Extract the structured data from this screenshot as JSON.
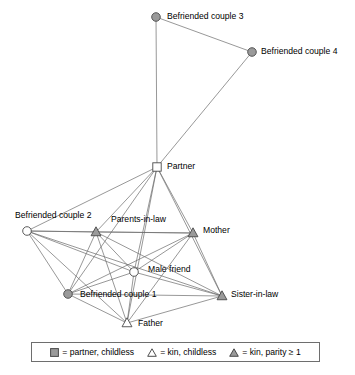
{
  "figure": {
    "type": "network-diagram"
  },
  "nodes": [
    {
      "id": "befriended_couple_3",
      "label": "Befriended couple 3",
      "shape": "circle",
      "fill": "#9a9a9a",
      "x": 156,
      "y": 17,
      "label_x": 167,
      "label_y": 17,
      "label_anchor": "start"
    },
    {
      "id": "befriended_couple_4",
      "label": "Befriended couple 4",
      "shape": "circle",
      "fill": "#9a9a9a",
      "x": 252,
      "y": 52,
      "label_x": 261,
      "label_y": 52,
      "label_anchor": "start"
    },
    {
      "id": "partner",
      "label": "Partner",
      "shape": "square",
      "fill": "#ffffff",
      "x": 157,
      "y": 167,
      "label_x": 167,
      "label_y": 167,
      "label_anchor": "start"
    },
    {
      "id": "befriended_couple_2",
      "label": "Befriended couple 2",
      "shape": "circle",
      "fill": "#ffffff",
      "x": 27,
      "y": 231,
      "label_x": 15,
      "label_y": 216,
      "label_anchor": "start"
    },
    {
      "id": "parents_in_law",
      "label": "Parents-in-law",
      "shape": "triangle",
      "fill": "#9a9a9a",
      "x": 96,
      "y": 232,
      "label_x": 111,
      "label_y": 220,
      "label_anchor": "start"
    },
    {
      "id": "mother",
      "label": "Mother",
      "shape": "triangle",
      "fill": "#9a9a9a",
      "x": 193,
      "y": 233,
      "label_x": 203,
      "label_y": 231,
      "label_anchor": "start"
    },
    {
      "id": "male_friend",
      "label": "Male friend",
      "shape": "circle",
      "fill": "#ffffff",
      "x": 134,
      "y": 272,
      "label_x": 148,
      "label_y": 270,
      "label_anchor": "start"
    },
    {
      "id": "befriended_couple_1",
      "label": "Befriended couple 1",
      "shape": "circle",
      "fill": "#9a9a9a",
      "x": 68,
      "y": 294,
      "label_x": 80,
      "label_y": 295,
      "label_anchor": "start"
    },
    {
      "id": "sister_in_law",
      "label": "Sister-in-law",
      "shape": "triangle",
      "fill": "#9a9a9a",
      "x": 222,
      "y": 296,
      "label_x": 231,
      "label_y": 295,
      "label_anchor": "start"
    },
    {
      "id": "father",
      "label": "Father",
      "shape": "triangle",
      "fill": "#ffffff",
      "x": 127,
      "y": 323,
      "label_x": 138,
      "label_y": 324,
      "label_anchor": "start"
    }
  ],
  "edges": [
    {
      "source": "befriended_couple_3",
      "target": "befriended_couple_4"
    },
    {
      "source": "befriended_couple_3",
      "target": "partner"
    },
    {
      "source": "befriended_couple_4",
      "target": "partner"
    },
    {
      "source": "partner",
      "target": "befriended_couple_2"
    },
    {
      "source": "partner",
      "target": "parents_in_law"
    },
    {
      "source": "partner",
      "target": "mother"
    },
    {
      "source": "partner",
      "target": "male_friend"
    },
    {
      "source": "partner",
      "target": "befriended_couple_1"
    },
    {
      "source": "partner",
      "target": "sister_in_law"
    },
    {
      "source": "partner",
      "target": "father"
    },
    {
      "source": "befriended_couple_2",
      "target": "parents_in_law"
    },
    {
      "source": "befriended_couple_2",
      "target": "mother"
    },
    {
      "source": "befriended_couple_2",
      "target": "male_friend"
    },
    {
      "source": "befriended_couple_2",
      "target": "befriended_couple_1"
    },
    {
      "source": "befriended_couple_2",
      "target": "sister_in_law"
    },
    {
      "source": "befriended_couple_2",
      "target": "father"
    },
    {
      "source": "parents_in_law",
      "target": "mother"
    },
    {
      "source": "parents_in_law",
      "target": "male_friend"
    },
    {
      "source": "parents_in_law",
      "target": "befriended_couple_1"
    },
    {
      "source": "parents_in_law",
      "target": "sister_in_law"
    },
    {
      "source": "parents_in_law",
      "target": "father"
    },
    {
      "source": "mother",
      "target": "male_friend"
    },
    {
      "source": "mother",
      "target": "befriended_couple_1"
    },
    {
      "source": "mother",
      "target": "sister_in_law"
    },
    {
      "source": "mother",
      "target": "father"
    },
    {
      "source": "male_friend",
      "target": "befriended_couple_1"
    },
    {
      "source": "male_friend",
      "target": "sister_in_law"
    },
    {
      "source": "male_friend",
      "target": "father"
    },
    {
      "source": "befriended_couple_1",
      "target": "sister_in_law"
    },
    {
      "source": "befriended_couple_1",
      "target": "father"
    },
    {
      "source": "sister_in_law",
      "target": "father"
    }
  ],
  "legend": {
    "items": [
      {
        "glyph": "filled-square",
        "fill": "#9a9a9a",
        "text": "= partner, childless"
      },
      {
        "glyph": "open-triangle",
        "fill": "#ffffff",
        "text": "= kin, childless"
      },
      {
        "glyph": "filled-triangle",
        "fill": "#9a9a9a",
        "text": "= kin, parity ≥ 1"
      }
    ]
  },
  "style": {
    "edge_color": "#6b6b6b",
    "node_stroke": "#4a4a4a",
    "node_fill_gray": "#9a9a9a",
    "node_fill_white": "#ffffff",
    "background": "#ffffff"
  }
}
